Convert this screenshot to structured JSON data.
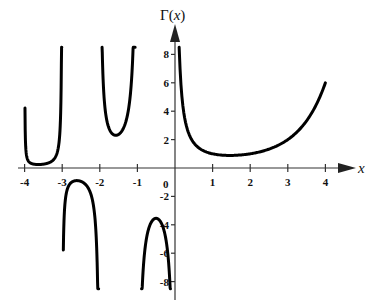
{
  "chart_data": {
    "type": "line",
    "title": "",
    "function": "Gamma function",
    "xlabel": "x",
    "ylabel": "Γ(x)",
    "xlim": [
      -4.2,
      4.6
    ],
    "ylim": [
      -8.5,
      9
    ],
    "grid": false,
    "legend": null,
    "x_ticks": [
      -4,
      -3,
      -2,
      -1,
      0,
      1,
      2,
      3,
      4
    ],
    "x_tick_labels": [
      "-4",
      "-3",
      "-2",
      "-1",
      "0",
      "1",
      "2",
      "3",
      "4"
    ],
    "y_ticks": [
      -8,
      -6,
      -4,
      -2,
      2,
      4,
      6,
      8
    ],
    "y_tick_labels": [
      "-8",
      "-6",
      "-4",
      "-2",
      "2",
      "4",
      "6",
      "8"
    ],
    "series": [
      {
        "name": "Γ(x), 0 < x ≤ 4",
        "x": [
          0.11,
          0.2,
          0.3,
          0.5,
          0.75,
          1.0,
          1.46,
          2.0,
          2.5,
          3.0,
          3.5,
          4.0
        ],
        "y": [
          8.5,
          4.59,
          2.99,
          1.77,
          1.23,
          1.0,
          0.886,
          1.0,
          1.33,
          2.0,
          3.32,
          6.0
        ]
      },
      {
        "name": "Γ(x), -1 < x < 0",
        "x": [
          -0.89,
          -0.8,
          -0.7,
          -0.6,
          -0.5,
          -0.4,
          -0.3,
          -0.2,
          -0.12
        ],
        "y": [
          -8.5,
          -5.74,
          -4.27,
          -3.7,
          -3.54,
          -3.72,
          -4.33,
          -5.82,
          -8.5
        ]
      },
      {
        "name": "Γ(x), -2 < x < -1",
        "x": [
          -1.94,
          -1.9,
          -1.8,
          -1.7,
          -1.6,
          -1.5,
          -1.4,
          -1.3,
          -1.2,
          -1.1,
          -1.06
        ],
        "y": [
          8.5,
          5.56,
          3.19,
          2.53,
          2.31,
          2.36,
          2.66,
          3.33,
          4.85,
          9.71,
          8.5
        ]
      },
      {
        "name": "Γ(x), -3 < x < -2",
        "x": [
          -2.97,
          -2.9,
          -2.8,
          -2.7,
          -2.6,
          -2.5,
          -2.4,
          -2.3,
          -2.2,
          -2.1,
          -2.03
        ],
        "y": [
          -8.5,
          -5.06,
          -2.54,
          -1.9,
          -1.82,
          -0.945,
          -1.06,
          -1.45,
          -2.2,
          -4.85,
          -8.5
        ]
      },
      {
        "name": "Γ(x), -4 < x < -3",
        "x": [
          -3.99,
          -3.95,
          -3.9,
          -3.8,
          -3.7,
          -3.6,
          -3.5,
          -3.4,
          -3.3,
          -3.2,
          -3.1,
          -3.05,
          -3.01
        ],
        "y": [
          8.5,
          4.3,
          1.79,
          0.83,
          0.53,
          0.4,
          0.27,
          0.31,
          0.44,
          0.69,
          1.57,
          3.3,
          8.5
        ]
      }
    ]
  },
  "labels": {
    "y_axis_title_main": "Γ(",
    "y_axis_title_var": "x",
    "y_axis_title_close": ")",
    "x_axis_title": "x",
    "origin_label": "0",
    "x_tick_labels": [
      "-4",
      "-3",
      "-2",
      "-1",
      "1",
      "2",
      "3",
      "4"
    ],
    "y_tick_labels": [
      "8",
      "6",
      "4",
      "2",
      "-2",
      "-4",
      "-6",
      "-8"
    ]
  }
}
